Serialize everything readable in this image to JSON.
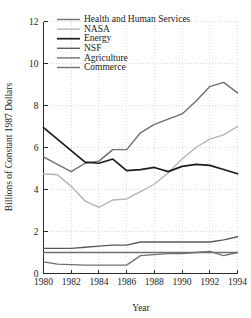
{
  "chart_data": {
    "type": "line",
    "title": "",
    "xlabel": "Year",
    "ylabel": "Billions of Constant 1987 Dollars",
    "xlim": [
      1980,
      1994
    ],
    "ylim": [
      0,
      12
    ],
    "xticks": [
      1980,
      1982,
      1984,
      1986,
      1988,
      1990,
      1992,
      1994
    ],
    "yticks": [
      0,
      2,
      4,
      6,
      8,
      10,
      12
    ],
    "xtick_labels": [
      "1980",
      "1982",
      "1984",
      "1986",
      "1988",
      "1990",
      "1992",
      "1994"
    ],
    "ytick_labels": [
      "0",
      "2",
      "4",
      "6",
      "8",
      "10",
      "12"
    ],
    "grid": true,
    "legend_position": "upper-left-inside",
    "x": [
      1980,
      1981,
      1982,
      1983,
      1984,
      1985,
      1986,
      1987,
      1988,
      1989,
      1990,
      1991,
      1992,
      1993,
      1994
    ],
    "series": [
      {
        "name": "Health and Human Services",
        "color": "#6e6e6e",
        "width": 1.4,
        "values": [
          5.55,
          5.2,
          4.85,
          5.25,
          5.35,
          5.9,
          5.9,
          6.7,
          7.1,
          7.35,
          7.6,
          8.2,
          8.9,
          9.1,
          8.6
        ]
      },
      {
        "name": "NASA",
        "color": "#b4b4b4",
        "width": 1.4,
        "values": [
          4.75,
          4.7,
          4.15,
          3.45,
          3.15,
          3.5,
          3.55,
          3.9,
          4.25,
          4.8,
          5.45,
          6.0,
          6.4,
          6.6,
          7.0
        ]
      },
      {
        "name": "Energy",
        "color": "#1c1c1c",
        "width": 1.7,
        "values": [
          6.95,
          6.4,
          5.85,
          5.3,
          5.25,
          5.45,
          4.9,
          4.95,
          5.05,
          4.85,
          5.1,
          5.2,
          5.15,
          4.95,
          4.75
        ]
      },
      {
        "name": "NSF",
        "color": "#5a5a5a",
        "width": 1.3,
        "values": [
          1.2,
          1.2,
          1.2,
          1.25,
          1.3,
          1.35,
          1.35,
          1.5,
          1.5,
          1.5,
          1.5,
          1.5,
          1.5,
          1.6,
          1.75
        ]
      },
      {
        "name": "Agriculture",
        "color": "#707070",
        "width": 1.3,
        "values": [
          1.0,
          1.0,
          1.0,
          1.0,
          1.0,
          1.0,
          1.0,
          1.0,
          1.0,
          1.0,
          1.0,
          1.0,
          1.0,
          1.0,
          1.0
        ]
      },
      {
        "name": "Commerce",
        "color": "#707070",
        "width": 1.3,
        "values": [
          0.55,
          0.45,
          0.42,
          0.4,
          0.4,
          0.4,
          0.4,
          0.85,
          0.9,
          0.95,
          0.95,
          1.0,
          1.05,
          0.85,
          1.0
        ]
      }
    ]
  },
  "legend": {
    "items": [
      {
        "label": "Health and Human Services",
        "color": "#6e6e6e"
      },
      {
        "label": "NASA",
        "color": "#b4b4b4"
      },
      {
        "label": "Energy",
        "color": "#1c1c1c"
      },
      {
        "label": "NSF",
        "color": "#5a5a5a"
      },
      {
        "label": "Agriculture",
        "color": "#707070"
      },
      {
        "label": "Commerce",
        "color": "#707070"
      }
    ]
  }
}
